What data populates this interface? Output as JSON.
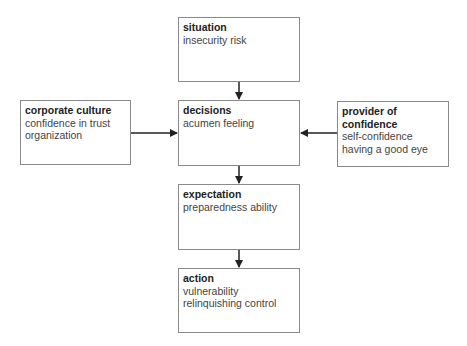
{
  "diagram": {
    "nodes": [
      {
        "id": "situation",
        "title": "situation",
        "lines": [
          "insecurity risk"
        ]
      },
      {
        "id": "decisions",
        "title": "decisions",
        "lines": [
          "acumen feeling"
        ]
      },
      {
        "id": "corporate_culture",
        "title": "corporate culture",
        "lines": [
          "confidence in trust",
          "organization"
        ]
      },
      {
        "id": "provider",
        "title": "provider of confidence",
        "lines": [
          "self-confidence",
          "having a good eye"
        ]
      },
      {
        "id": "expectation",
        "title": "expectation",
        "lines": [
          "preparedness ability"
        ]
      },
      {
        "id": "action",
        "title": "action",
        "lines": [
          "vulnerability",
          "relinquishing control"
        ]
      }
    ],
    "edges": [
      {
        "from": "situation",
        "to": "decisions"
      },
      {
        "from": "corporate_culture",
        "to": "decisions"
      },
      {
        "from": "provider",
        "to": "decisions"
      },
      {
        "from": "decisions",
        "to": "expectation"
      },
      {
        "from": "expectation",
        "to": "action"
      }
    ],
    "colors": {
      "border": "#8a8a8a",
      "arrow": "#222222",
      "text": "#444444"
    }
  }
}
